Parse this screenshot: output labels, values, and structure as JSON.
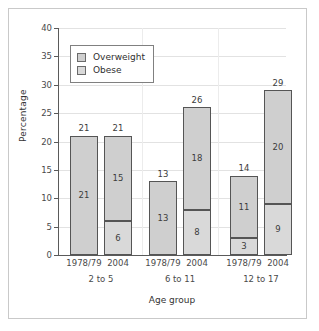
{
  "chart_data": {
    "type": "bar",
    "subtype": "stacked",
    "title": "",
    "xlabel": "Age group",
    "ylabel": "Percentage",
    "ylim": [
      0,
      40
    ],
    "yticks": [
      0,
      5,
      10,
      15,
      20,
      25,
      30,
      35,
      40
    ],
    "ytick_labels": [
      "0",
      "5",
      "10",
      "15",
      "20",
      "25",
      "30",
      "35",
      "40"
    ],
    "grid": "horizontal-and-vertical",
    "legend_position": "upper-left-inside",
    "categories": [
      "1978/79",
      "2004",
      "1978/79",
      "2004",
      "1978/79",
      "2004"
    ],
    "groups": [
      "2 to 5",
      "6 to 11",
      "12 to 17"
    ],
    "series": [
      {
        "name": "Obese",
        "color": "#d9d9d9",
        "values": [
          0,
          6,
          0,
          8,
          3,
          9
        ]
      },
      {
        "name": "Overweight",
        "color": "#cfcfcf",
        "values": [
          21,
          15,
          13,
          18,
          11,
          20
        ]
      }
    ],
    "totals": [
      21,
      21,
      13,
      26,
      14,
      29
    ],
    "bars": [
      {
        "group": "2 to 5",
        "year": "1978/79",
        "obese": 0,
        "obese_label": "",
        "overweight": 21,
        "overweight_label": "21",
        "total": 21,
        "total_label": "21"
      },
      {
        "group": "2 to 5",
        "year": "2004",
        "obese": 6,
        "obese_label": "6",
        "overweight": 15,
        "overweight_label": "15",
        "total": 21,
        "total_label": "21"
      },
      {
        "group": "6 to 11",
        "year": "1978/79",
        "obese": 0,
        "obese_label": "",
        "overweight": 13,
        "overweight_label": "13",
        "total": 13,
        "total_label": "13"
      },
      {
        "group": "6 to 11",
        "year": "2004",
        "obese": 8,
        "obese_label": "8",
        "overweight": 18,
        "overweight_label": "18",
        "total": 26,
        "total_label": "26"
      },
      {
        "group": "12 to 17",
        "year": "1978/79",
        "obese": 3,
        "obese_label": "3",
        "overweight": 11,
        "overweight_label": "11",
        "total": 14,
        "total_label": "14"
      },
      {
        "group": "12 to 17",
        "year": "2004",
        "obese": 9,
        "obese_label": "9",
        "overweight": 20,
        "overweight_label": "20",
        "total": 29,
        "total_label": "29"
      }
    ]
  },
  "axes": {
    "y_label": "Percentage",
    "x_label": "Age group",
    "y_ticks": [
      {
        "value": 40,
        "label": "40"
      },
      {
        "value": 35,
        "label": "35"
      },
      {
        "value": 30,
        "label": "30"
      },
      {
        "value": 25,
        "label": "25"
      },
      {
        "value": 20,
        "label": "20"
      },
      {
        "value": 15,
        "label": "15"
      },
      {
        "value": 10,
        "label": "10"
      },
      {
        "value": 5,
        "label": "5"
      },
      {
        "value": 0,
        "label": "0"
      }
    ],
    "x_ticks": [
      {
        "label": "1978/79"
      },
      {
        "label": "2004"
      },
      {
        "label": "1978/79"
      },
      {
        "label": "2004"
      },
      {
        "label": "1978/79"
      },
      {
        "label": "2004"
      }
    ],
    "x_groups": [
      {
        "label": "2 to 5"
      },
      {
        "label": "6 to 11"
      },
      {
        "label": "12 to 17"
      }
    ]
  },
  "legend": {
    "items": [
      {
        "label": "Overweight",
        "color": "#cfcfcf"
      },
      {
        "label": "Obese",
        "color": "#d9d9d9"
      }
    ]
  },
  "colors": {
    "bar_fill_overweight": "#cfcfcf",
    "bar_fill_obese": "#d9d9d9",
    "bar_border": "#555555",
    "gridline": "#e2e2e2",
    "axis": "#5a5a5a",
    "frame_border": "#c9c9c9",
    "background": "#ffffff"
  }
}
